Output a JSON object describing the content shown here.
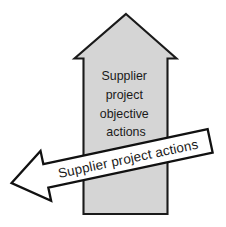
{
  "diagram": {
    "background_color": "#ffffff",
    "shapes": {
      "up_arrow": {
        "name": "upward-block-arrow",
        "fill_color": "#d5d5d5",
        "stroke_color": "#1a1a1a",
        "label_lines": [
          "Supplier",
          "project",
          "objective",
          "actions"
        ]
      },
      "left_arrow": {
        "name": "leftward-block-arrow",
        "fill_color": "#ffffff",
        "stroke_color": "#111111",
        "rotation_degrees": -12,
        "label": "Supplier project actions"
      }
    }
  }
}
